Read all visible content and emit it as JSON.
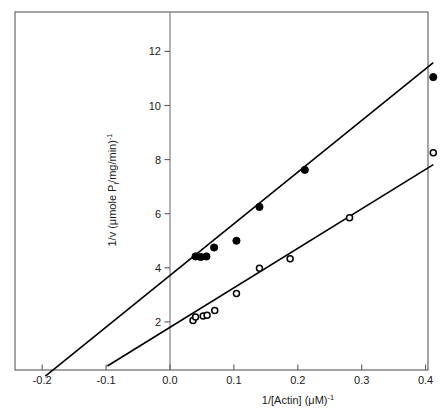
{
  "chart_data": {
    "type": "scatter",
    "title": "",
    "subtitle": "",
    "xlabel": "1/[Actin]  (μM)⁻¹",
    "xlabel_parts": {
      "base": "1/[Actin]  (μM)",
      "exponent": "-1"
    },
    "ylabel": "1/v (μmole Pᵢ/mg/min)⁻¹",
    "ylabel_parts": {
      "pre": "1/v (μmole P",
      "subscript": "i",
      "mid": "/mg/min)",
      "exponent": "-1"
    },
    "xlim": [
      -0.24,
      0.44
    ],
    "ylim": [
      0,
      12.9
    ],
    "xticks": [
      -0.2,
      -0.1,
      0.0,
      0.1,
      0.2,
      0.3,
      0.4
    ],
    "xticklabels": [
      "-0.2",
      "-0.1",
      "0.0",
      "0.1",
      "0.2",
      "0.3",
      "0.4"
    ],
    "yticks": [
      2,
      4,
      6,
      8,
      10,
      12
    ],
    "yticklabels": [
      "2",
      "4",
      "6",
      "8",
      "10",
      "12"
    ],
    "grid": false,
    "legend": "none",
    "zero_axis_vertical": 0.0,
    "series": [
      {
        "name": "filled-circles",
        "marker": "filled-circle",
        "color": "#000000",
        "x_intercept": -0.195,
        "y_intercept": 3.72,
        "slope": 19.1,
        "points": [
          {
            "x": 0.04,
            "y": 4.42
          },
          {
            "x": 0.048,
            "y": 4.4
          },
          {
            "x": 0.057,
            "y": 4.42
          },
          {
            "x": 0.069,
            "y": 4.75
          },
          {
            "x": 0.104,
            "y": 5.0
          },
          {
            "x": 0.14,
            "y": 6.25
          },
          {
            "x": 0.211,
            "y": 7.62
          },
          {
            "x": 0.412,
            "y": 11.05
          }
        ]
      },
      {
        "name": "open-circles",
        "marker": "open-circle",
        "color": "#000000",
        "x_intercept": -0.098,
        "y_intercept": 1.8,
        "slope": 14.6,
        "points": [
          {
            "x": 0.036,
            "y": 2.05
          },
          {
            "x": 0.04,
            "y": 2.18
          },
          {
            "x": 0.052,
            "y": 2.22
          },
          {
            "x": 0.058,
            "y": 2.25
          },
          {
            "x": 0.07,
            "y": 2.42
          },
          {
            "x": 0.104,
            "y": 3.05
          },
          {
            "x": 0.14,
            "y": 3.98
          },
          {
            "x": 0.188,
            "y": 4.33
          },
          {
            "x": 0.281,
            "y": 5.85
          },
          {
            "x": 0.412,
            "y": 8.25
          }
        ]
      }
    ]
  }
}
